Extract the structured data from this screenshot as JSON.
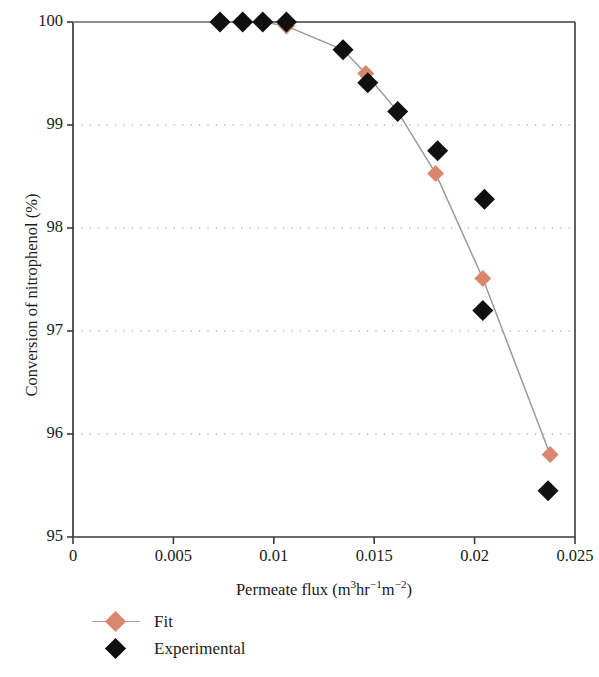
{
  "chart_data": {
    "type": "scatter",
    "title": "",
    "xlabel": "Permeate flux (m3hr-1m-2)",
    "xlabel_parts": {
      "text": "Permeate flux (m",
      "sup1": "3",
      "mid1": "hr",
      "sup2": "−1",
      "mid2": "m",
      "sup3": "−2",
      "tail": ")"
    },
    "ylabel": "Conversion of nitrophenol (%)",
    "xlim": [
      0,
      0.025
    ],
    "ylim": [
      95,
      100
    ],
    "xticks": [
      "0",
      "0.005",
      "0.01",
      "0.015",
      "0.02",
      "0.025"
    ],
    "xtick_values": [
      0,
      0.005,
      0.01,
      0.015,
      0.02,
      0.025
    ],
    "yticks": [
      "95",
      "96",
      "97",
      "98",
      "99",
      "100"
    ],
    "ytick_values": [
      95,
      96,
      97,
      98,
      99,
      100
    ],
    "grid": "horizontal-dotted",
    "legend_position": "below-left",
    "series": [
      {
        "name": "Fit",
        "marker": "diamond",
        "color": "#d9876e",
        "line_color": "#9a9a9a",
        "has_line": true,
        "points": [
          {
            "x": 0.00732,
            "y": 100.0
          },
          {
            "x": 0.00845,
            "y": 100.0
          },
          {
            "x": 0.00945,
            "y": 100.0
          },
          {
            "x": 0.01063,
            "y": 99.96
          },
          {
            "x": 0.01345,
            "y": 99.73
          },
          {
            "x": 0.01458,
            "y": 99.5
          },
          {
            "x": 0.01617,
            "y": 99.13
          },
          {
            "x": 0.01806,
            "y": 98.53
          },
          {
            "x": 0.02041,
            "y": 97.51
          },
          {
            "x": 0.02376,
            "y": 95.8
          }
        ]
      },
      {
        "name": "Experimental",
        "marker": "diamond",
        "color": "#101010",
        "has_line": false,
        "points": [
          {
            "x": 0.00732,
            "y": 100.0
          },
          {
            "x": 0.00845,
            "y": 100.0
          },
          {
            "x": 0.00945,
            "y": 100.0
          },
          {
            "x": 0.01063,
            "y": 100.0
          },
          {
            "x": 0.01345,
            "y": 99.73
          },
          {
            "x": 0.01468,
            "y": 99.41
          },
          {
            "x": 0.01617,
            "y": 99.13
          },
          {
            "x": 0.01816,
            "y": 98.75
          },
          {
            "x": 0.02049,
            "y": 98.28
          },
          {
            "x": 0.02041,
            "y": 97.2
          },
          {
            "x": 0.02366,
            "y": 95.45
          }
        ]
      }
    ]
  },
  "legend": {
    "items": [
      {
        "label": "Fit",
        "marker": "fit-diamond-icon"
      },
      {
        "label": "Experimental",
        "marker": "experimental-diamond-icon"
      }
    ]
  },
  "colors": {
    "fit_marker": "#d9876e",
    "fit_line": "#9a9a9a",
    "experimental_marker": "#101010",
    "axis": "#3a3a3a",
    "grid": "#8d8d8d",
    "background": "#ffffff"
  }
}
